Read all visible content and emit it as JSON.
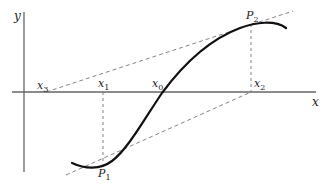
{
  "diagram": {
    "axes": {
      "x_label": "x",
      "y_label": "y",
      "color": "#555555"
    },
    "points": {
      "P1": {
        "label": "P",
        "sub": "1"
      },
      "P2": {
        "label": "P",
        "sub": "2"
      }
    },
    "x_marks": [
      {
        "id": "x3",
        "label": "x",
        "sub": "3"
      },
      {
        "id": "x1",
        "label": "x",
        "sub": "1"
      },
      {
        "id": "x0",
        "label": "x",
        "sub": "0"
      },
      {
        "id": "x2",
        "label": "x",
        "sub": "2"
      }
    ],
    "colors": {
      "curve": "#111111",
      "dashed": "#777777",
      "axis": "#666666"
    }
  }
}
